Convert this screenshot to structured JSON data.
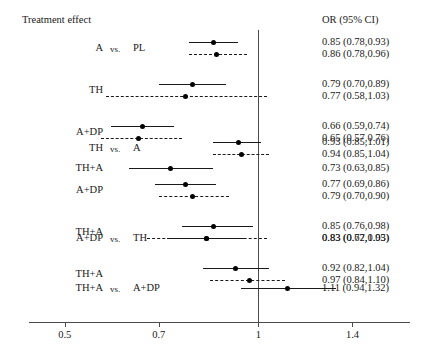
{
  "header": {
    "left_title": "Treatment effect",
    "right_title": "OR (95% CI)"
  },
  "axis": {
    "ticks": [
      {
        "label": "0.5",
        "value": 0.5
      },
      {
        "label": "0.7",
        "value": 0.7
      },
      {
        "label": "1",
        "value": 1
      },
      {
        "label": "1.4",
        "value": 1.4
      }
    ],
    "null_value": 1,
    "scale": "log",
    "xmin": 0.44,
    "xmax": 1.72
  },
  "chart_data": {
    "type": "forest",
    "title": "Treatment effect",
    "xlabel": "",
    "ylabel": "",
    "effect_measure": "OR (95% CI)",
    "scale": "log",
    "xlim": [
      0.44,
      1.72
    ],
    "ticks": [
      0.5,
      0.7,
      1,
      1.4
    ],
    "tick_labels": [
      "0.5",
      "0.7",
      "1",
      "1.4"
    ],
    "reference_line": 1,
    "grid": false,
    "legend": "none",
    "groups": [
      {
        "comparator": "PL",
        "rows": [
          {
            "treatment": "A",
            "vs": "vs.",
            "comparator": "PL",
            "show_comparison": true,
            "estimates": [
              {
                "style": "solid",
                "or": 0.85,
                "lcl": 0.78,
                "ucl": 0.93,
                "text": "0.85 (0.78,0.93)"
              },
              {
                "style": "dashed",
                "or": 0.86,
                "lcl": 0.78,
                "ucl": 0.96,
                "text": "0.86 (0.78,0.96)"
              }
            ]
          },
          {
            "treatment": "TH",
            "vs": "",
            "comparator": "",
            "show_comparison": false,
            "estimates": [
              {
                "style": "solid",
                "or": 0.79,
                "lcl": 0.7,
                "ucl": 0.89,
                "text": "0.79 (0.70,0.89)"
              },
              {
                "style": "dashed",
                "or": 0.77,
                "lcl": 0.58,
                "ucl": 1.03,
                "text": "0.77 (0.58,1.03)"
              }
            ]
          },
          {
            "treatment": "A+DP",
            "vs": "",
            "comparator": "",
            "show_comparison": false,
            "estimates": [
              {
                "style": "solid",
                "or": 0.66,
                "lcl": 0.59,
                "ucl": 0.74,
                "text": "0.66 (0.59,0.74)"
              },
              {
                "style": "dashed",
                "or": 0.65,
                "lcl": 0.57,
                "ucl": 0.76,
                "text": "0.65 (0.57,0.76)"
              }
            ]
          },
          {
            "treatment": "TH+A",
            "vs": "",
            "comparator": "",
            "show_comparison": false,
            "estimates": [
              {
                "style": "solid",
                "or": 0.73,
                "lcl": 0.63,
                "ucl": 0.85,
                "text": "0.73 (0.63,0.85)"
              }
            ]
          }
        ]
      },
      {
        "comparator": "A",
        "rows": [
          {
            "treatment": "TH",
            "vs": "vs.",
            "comparator": "A",
            "show_comparison": true,
            "estimates": [
              {
                "style": "solid",
                "or": 0.93,
                "lcl": 0.85,
                "ucl": 1.01,
                "text": "0.93 (0.85,1.01)"
              },
              {
                "style": "dashed",
                "or": 0.94,
                "lcl": 0.85,
                "ucl": 1.04,
                "text": "0.94 (0.85,1.04)"
              }
            ]
          },
          {
            "treatment": "A+DP",
            "vs": "",
            "comparator": "",
            "show_comparison": false,
            "estimates": [
              {
                "style": "solid",
                "or": 0.77,
                "lcl": 0.69,
                "ucl": 0.86,
                "text": "0.77 (0.69,0.86)"
              },
              {
                "style": "dashed",
                "or": 0.79,
                "lcl": 0.7,
                "ucl": 0.9,
                "text": "0.79 (0.70,0.90)"
              }
            ]
          },
          {
            "treatment": "TH+A",
            "vs": "",
            "comparator": "",
            "show_comparison": false,
            "estimates": [
              {
                "style": "solid",
                "or": 0.85,
                "lcl": 0.76,
                "ucl": 0.98,
                "text": "0.85 (0.76,0.98)"
              },
              {
                "style": "dashed",
                "or": 0.83,
                "lcl": 0.67,
                "ucl": 1.03,
                "text": "0.83 (0.67,1.03)"
              }
            ]
          }
        ]
      },
      {
        "comparator": "TH",
        "rows": [
          {
            "treatment": "A+DP",
            "vs": "vs.",
            "comparator": "TH",
            "show_comparison": true,
            "estimates": [
              {
                "style": "solid",
                "or": 0.83,
                "lcl": 0.72,
                "ucl": 0.95,
                "text": "0.83 (0.72,0.95)"
              }
            ]
          },
          {
            "treatment": "TH+A",
            "vs": "",
            "comparator": "",
            "show_comparison": false,
            "estimates": [
              {
                "style": "solid",
                "or": 0.92,
                "lcl": 0.82,
                "ucl": 1.04,
                "text": "0.92 (0.82,1.04)"
              },
              {
                "style": "dashed",
                "or": 0.97,
                "lcl": 0.84,
                "ucl": 1.1,
                "text": "0.97 (0.84,1.10)"
              }
            ]
          }
        ]
      },
      {
        "comparator": "A+DP",
        "rows": [
          {
            "treatment": "TH+A",
            "vs": "vs.",
            "comparator": "A+DP",
            "show_comparison": true,
            "estimates": [
              {
                "style": "solid",
                "or": 1.11,
                "lcl": 0.94,
                "ucl": 1.32,
                "text": "1.11 (0.94,1.32)"
              }
            ]
          }
        ]
      }
    ]
  }
}
